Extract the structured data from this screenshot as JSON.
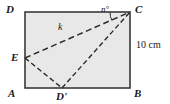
{
  "figure": {
    "type": "geometry-diagram",
    "fill_color": "#e8e8e8",
    "stroke_color": "#3a3a3a",
    "dash_color": "#2b2b2b",
    "background": "#ffffff"
  },
  "labels": {
    "vertex_top_left": "D",
    "vertex_top_right": "C",
    "vertex_bottom_left": "A",
    "vertex_bottom_right": "B",
    "point_left_side": "E",
    "point_bottom_side": "D'",
    "segment_EC": "k",
    "angle_at_C": "n°",
    "side_BC_length": "10 cm"
  },
  "geometry": {
    "rect": {
      "x": 25,
      "y": 12,
      "width": 105,
      "height": 76
    },
    "points": {
      "D": [
        25,
        12
      ],
      "C": [
        130,
        12
      ],
      "A": [
        25,
        88
      ],
      "B": [
        130,
        88
      ],
      "E": [
        25,
        58
      ],
      "Dprime": [
        62,
        88
      ]
    },
    "dashed_segments": [
      [
        "E",
        "C"
      ],
      [
        "E",
        "Dprime"
      ],
      [
        "Dprime",
        "C"
      ]
    ],
    "angle_arc": {
      "vertex": "C",
      "radius": 20,
      "label": "n°"
    }
  }
}
